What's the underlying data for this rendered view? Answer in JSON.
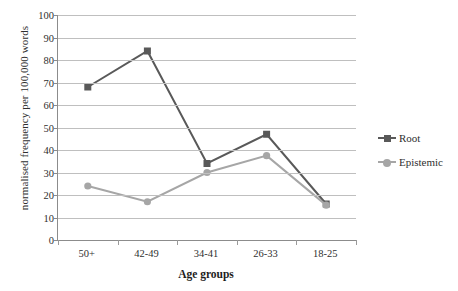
{
  "chart_data": {
    "type": "line",
    "title": "",
    "xlabel": "Age groups",
    "ylabel": "normalised frequency per 100,000 words",
    "categories": [
      "50+",
      "42-49",
      "34-41",
      "26-33",
      "18-25"
    ],
    "ylim": [
      0,
      100
    ],
    "ytick_step": 10,
    "yticks": [
      "100",
      "90",
      "80",
      "70",
      "60",
      "50",
      "40",
      "30",
      "20",
      "10",
      "0"
    ],
    "grid": true,
    "legend_position": "right",
    "series": [
      {
        "name": "Root",
        "color": "#595959",
        "marker": "square",
        "values": [
          68,
          84,
          34,
          47,
          16
        ]
      },
      {
        "name": "Epistemic",
        "color": "#a6a6a6",
        "marker": "circle",
        "values": [
          24,
          17,
          30,
          37.5,
          15.5
        ]
      }
    ]
  },
  "legend": {
    "items": [
      {
        "label": "Root"
      },
      {
        "label": "Epistemic"
      }
    ]
  },
  "colors": {
    "root": "#595959",
    "epistemic": "#a6a6a6",
    "axis": "#8c8c8c",
    "grid": "#bfbfbf",
    "text": "#2f2f2f",
    "background": "#ffffff"
  }
}
